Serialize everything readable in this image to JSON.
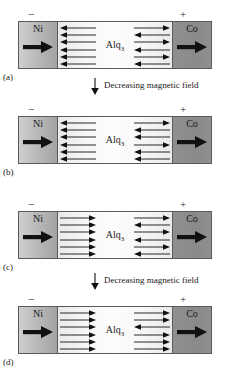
{
  "figure": {
    "type": "schematic-diagram",
    "colors": {
      "ni_electrode": "#b6b6b6",
      "co_electrode": "#8c8c8c",
      "organic_spacer": "#f7f7f7",
      "outline": "#5a5a5a",
      "arrow": "#111111"
    },
    "transition_label": "Decreasing magnetic field",
    "polarity_left": "−",
    "polarity_right": "+",
    "electrode_left_label": "Ni",
    "electrode_right_label": "Co",
    "spacer_label": "Alq",
    "spacer_label_sub": "3"
  },
  "panels": [
    {
      "caption": "(a)",
      "left_electrode": "Ni",
      "right_electrode": "Co",
      "spacer": "Alq3",
      "polarity_left": "−",
      "polarity_right": "+",
      "left_electrode_magnetization": "right",
      "right_electrode_magnetization": "right",
      "left_spin_arrows": [
        "left",
        "left",
        "left",
        "left",
        "left",
        "left"
      ],
      "right_spin_arrows": [
        "right",
        "left",
        "right",
        "left",
        "right",
        "left"
      ]
    },
    {
      "caption": "(b)",
      "left_electrode": "Ni",
      "right_electrode": "Co",
      "spacer": "Alq3",
      "polarity_left": "−",
      "polarity_right": "+",
      "left_electrode_magnetization": "right",
      "right_electrode_magnetization": "right",
      "left_spin_arrows": [
        "left",
        "left",
        "left",
        "left",
        "left",
        "left"
      ],
      "right_spin_arrows": [
        "right",
        "left",
        "left",
        "right",
        "left",
        "left"
      ]
    },
    {
      "caption": "(c)",
      "left_electrode": "Ni",
      "right_electrode": "Co",
      "spacer": "Alq3",
      "polarity_left": "−",
      "polarity_right": "+",
      "left_electrode_magnetization": "right",
      "right_electrode_magnetization": "right",
      "left_spin_arrows": [
        "right",
        "right",
        "right",
        "right",
        "right",
        "right"
      ],
      "right_spin_arrows": [
        "right",
        "left",
        "right",
        "left",
        "right",
        "left"
      ]
    },
    {
      "caption": "(d)",
      "left_electrode": "Ni",
      "right_electrode": "Co",
      "spacer": "Alq3",
      "polarity_left": "−",
      "polarity_right": "+",
      "left_electrode_magnetization": "right",
      "right_electrode_magnetization": "right",
      "left_spin_arrows": [
        "right",
        "right",
        "right",
        "right",
        "right",
        "right"
      ],
      "right_spin_arrows": [
        "right",
        "right",
        "left",
        "right",
        "right",
        "right"
      ]
    }
  ],
  "transitions": [
    {
      "label": "Decreasing magnetic field",
      "between": "a-b"
    },
    {
      "label": "Decreasing magnetic field",
      "between": "c-d"
    }
  ]
}
